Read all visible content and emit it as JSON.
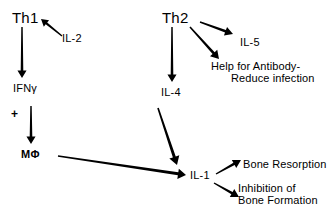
{
  "diagram": {
    "colors": {
      "ink": "#000000",
      "background": "#ffffff"
    },
    "nodes": [
      {
        "id": "th1",
        "label": "Th1",
        "x": 12,
        "y": 10,
        "style": "lbl-cell"
      },
      {
        "id": "il2",
        "label": "IL-2",
        "x": 62,
        "y": 32,
        "style": "lbl-cytokine"
      },
      {
        "id": "ifng",
        "label": "IFNγ",
        "x": 13,
        "y": 82,
        "style": "lbl-cytokine"
      },
      {
        "id": "plus",
        "label": "+",
        "x": 11,
        "y": 108,
        "style": "lbl-plus"
      },
      {
        "id": "mphi",
        "label": "MΦ",
        "x": 21,
        "y": 148,
        "style": "lbl-macrophage"
      },
      {
        "id": "th2",
        "label": "Th2",
        "x": 162,
        "y": 10,
        "style": "lbl-cell"
      },
      {
        "id": "il5",
        "label": "IL-5",
        "x": 240,
        "y": 36,
        "style": "lbl-cytokine"
      },
      {
        "id": "il4",
        "label": "IL-4",
        "x": 161,
        "y": 86,
        "style": "lbl-cytokine"
      },
      {
        "id": "il1",
        "label": "IL-1",
        "x": 190,
        "y": 169,
        "style": "lbl-cytokine"
      }
    ],
    "multiline_labels": [
      {
        "id": "antibody-help",
        "line1": "Help for Antibody-",
        "line2": "Reduce infection",
        "x": 211,
        "y": 60,
        "style": "lbl-effect"
      },
      {
        "id": "bone-resorption",
        "line1": "Bone Resorption",
        "line2": "",
        "x": 243,
        "y": 158,
        "style": "lbl-effect"
      },
      {
        "id": "bone-inhibition",
        "line1": "Inhibition of",
        "line2": "Bone Formation",
        "x": 238,
        "y": 182,
        "style": "lbl-effect"
      }
    ],
    "arrows": [
      {
        "id": "th1-to-ifng",
        "from": "Th1",
        "to": "IFNγ",
        "x1": 22,
        "y1": 27,
        "x2": 22,
        "y2": 78,
        "width": 2.6,
        "head": 7.5
      },
      {
        "id": "th1-to-il2",
        "from": "Th1",
        "to": "IL-2",
        "x1": 62,
        "y1": 36,
        "x2": 41,
        "y2": 19,
        "width": 2.4,
        "head": 7.0
      },
      {
        "id": "ifng-to-mphi",
        "from": "IFNγ",
        "to": "MΦ",
        "x1": 31,
        "y1": 106,
        "x2": 31,
        "y2": 144,
        "width": 2.6,
        "head": 7.5
      },
      {
        "id": "mphi-to-il1",
        "from": "MΦ",
        "to": "IL-1",
        "x1": 58,
        "y1": 156,
        "x2": 186,
        "y2": 175,
        "width": 3.0,
        "head": 8.0
      },
      {
        "id": "th2-to-il4",
        "from": "Th2",
        "to": "IL-4",
        "x1": 172,
        "y1": 27,
        "x2": 172,
        "y2": 82,
        "width": 2.6,
        "head": 7.5
      },
      {
        "id": "th2-to-il5",
        "from": "Th2",
        "to": "IL-5",
        "x1": 200,
        "y1": 22,
        "x2": 233,
        "y2": 34,
        "width": 2.6,
        "head": 8.0
      },
      {
        "id": "th2-to-help",
        "from": "Th2",
        "to": "Help for Antibody-Reduce infection",
        "x1": 190,
        "y1": 27,
        "x2": 219,
        "y2": 59,
        "width": 2.8,
        "head": 8.0
      },
      {
        "id": "il4-to-il1",
        "from": "IL-4",
        "to": "IL-1",
        "x1": 158,
        "y1": 108,
        "x2": 177,
        "y2": 165,
        "width": 3.0,
        "head": 8.5
      },
      {
        "id": "il1-to-resorption",
        "from": "IL-1",
        "to": "Bone Resorption",
        "x1": 216,
        "y1": 174,
        "x2": 241,
        "y2": 160,
        "width": 2.6,
        "head": 8.0
      },
      {
        "id": "il1-to-inhibition",
        "from": "IL-1",
        "to": "Inhibition of Bone Formation",
        "x1": 214,
        "y1": 183,
        "x2": 239,
        "y2": 197,
        "width": 2.6,
        "head": 8.0
      }
    ]
  }
}
